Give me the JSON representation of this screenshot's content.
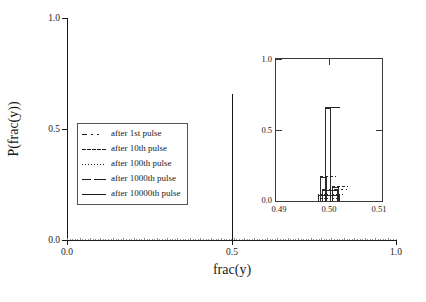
{
  "chart_data": {
    "type": "bar",
    "title": "",
    "xlabel": "frac(y)",
    "ylabel": "P(frac(y))",
    "xlim": [
      0.0,
      1.0
    ],
    "ylim": [
      0.0,
      1.0
    ],
    "x_ticks": [
      "0.0",
      "0.5",
      "1.0"
    ],
    "y_ticks": [
      "0.0",
      "0.5",
      "1.0"
    ],
    "grid": false,
    "legend_position": "center-left",
    "series": [
      {
        "name": "after 1st pulse",
        "style": "dash-dot",
        "peak_x": 0.5,
        "peak_y": 0.08
      },
      {
        "name": "after 10th pulse",
        "style": "dashed",
        "peak_x": 0.5,
        "peak_y": 0.1
      },
      {
        "name": "after 100th pulse",
        "style": "dotted",
        "peak_x": 0.5,
        "peak_y": 0.05
      },
      {
        "name": "after 1000th pulse",
        "style": "long-dash",
        "peak_x": 0.5,
        "peak_y": 0.17
      },
      {
        "name": "after 10000th pulse",
        "style": "solid",
        "peak_x": 0.5,
        "peak_y": 0.66
      }
    ],
    "main_spike": {
      "x": 0.5,
      "height": 0.66
    },
    "inset": {
      "xlim": [
        0.49,
        0.51
      ],
      "ylim": [
        0.0,
        1.0
      ],
      "x_ticks": [
        "0.49",
        "0.50",
        "0.51"
      ],
      "y_ticks": [
        "0.0",
        "0.5",
        "1.0"
      ],
      "bars": [
        {
          "series": "after 10000th pulse",
          "x_center": 0.4998,
          "width": 0.0012,
          "height": 0.66
        },
        {
          "series": "after 1000th pulse",
          "x_center": 0.4989,
          "width": 0.0013,
          "height": 0.17
        },
        {
          "series": "after 10th pulse",
          "x_center": 0.5012,
          "width": 0.0013,
          "height": 0.1
        },
        {
          "series": "after 1st pulse",
          "x_center": 0.5002,
          "width": 0.003,
          "height": 0.08
        },
        {
          "series": "after 100th pulse",
          "x_center": 0.5,
          "width": 0.004,
          "height": 0.04
        }
      ]
    }
  },
  "axes": {
    "y_title": "P(frac(y))",
    "x_title": "frac(y)",
    "y_tick_labels": [
      "0.0",
      "0.5",
      "1.0"
    ],
    "x_tick_labels": [
      "0.0",
      "0.5",
      "1.0"
    ]
  },
  "inset_axes": {
    "y_tick_labels": [
      "0.0",
      "0.5",
      "1.0"
    ],
    "x_tick_labels": [
      "0.49",
      "0.50",
      "0.51"
    ]
  },
  "legend": {
    "items": [
      {
        "label": "after 1st pulse",
        "style": "dash-dot"
      },
      {
        "label": "after 10th pulse",
        "style": "dashed"
      },
      {
        "label": "after 100th pulse",
        "style": "dotted"
      },
      {
        "label": "after 1000th pulse",
        "style": "long-dash"
      },
      {
        "label": "after 10000th pulse",
        "style": "solid"
      }
    ]
  },
  "colors": {
    "ink": "#1a1a1a",
    "frame": "#3a3a3a",
    "background": "#ffffff"
  }
}
